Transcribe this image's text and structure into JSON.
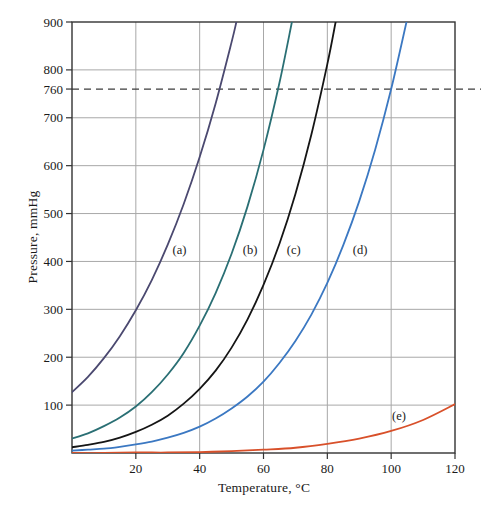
{
  "page": {
    "background": "#ffffff"
  },
  "chart_data": {
    "type": "line",
    "title": "",
    "xlabel": "Temperature, °C",
    "ylabel": "Pressure, mmHg",
    "xlim": [
      0,
      120
    ],
    "ylim": [
      0,
      900
    ],
    "x_ticks": [
      20,
      40,
      60,
      80,
      100,
      120
    ],
    "y_ticks": [
      100,
      200,
      300,
      400,
      500,
      600,
      700,
      800,
      900
    ],
    "x_gridlines": [
      20,
      40,
      60,
      80,
      100
    ],
    "y_gridlines": [
      100,
      200,
      300,
      400,
      500,
      600,
      700,
      800
    ],
    "grid": true,
    "legend_position": "none",
    "reference_line": {
      "value": 760,
      "label": "760",
      "style": "dashed"
    },
    "series": [
      {
        "name": "(a)",
        "color": "#4b4970",
        "points": [
          [
            0,
            127
          ],
          [
            5,
            159
          ],
          [
            10,
            198
          ],
          [
            15,
            244
          ],
          [
            20,
            298
          ],
          [
            25,
            361
          ],
          [
            30,
            435
          ],
          [
            35,
            520
          ],
          [
            40,
            618
          ],
          [
            45,
            730
          ],
          [
            50,
            858
          ],
          [
            51.5,
            900
          ]
        ]
      },
      {
        "name": "(b)",
        "color": "#2a6f74",
        "points": [
          [
            0,
            30
          ],
          [
            5,
            41
          ],
          [
            10,
            56
          ],
          [
            15,
            74
          ],
          [
            20,
            97
          ],
          [
            25,
            127
          ],
          [
            30,
            164
          ],
          [
            35,
            209
          ],
          [
            40,
            266
          ],
          [
            45,
            334
          ],
          [
            50,
            416
          ],
          [
            55,
            515
          ],
          [
            60,
            633
          ],
          [
            65,
            773
          ],
          [
            68.9,
            900
          ]
        ]
      },
      {
        "name": "(c)",
        "color": "#151515",
        "points": [
          [
            0,
            12
          ],
          [
            5,
            17
          ],
          [
            10,
            23
          ],
          [
            15,
            32
          ],
          [
            20,
            44
          ],
          [
            25,
            59
          ],
          [
            30,
            78
          ],
          [
            35,
            103
          ],
          [
            40,
            134
          ],
          [
            45,
            172
          ],
          [
            50,
            220
          ],
          [
            55,
            279
          ],
          [
            60,
            351
          ],
          [
            65,
            437
          ],
          [
            70,
            541
          ],
          [
            75,
            665
          ],
          [
            80,
            812
          ],
          [
            82.6,
            900
          ]
        ]
      },
      {
        "name": "(d)",
        "color": "#3b78c2",
        "points": [
          [
            0,
            5
          ],
          [
            5,
            7
          ],
          [
            10,
            9
          ],
          [
            15,
            13
          ],
          [
            20,
            18
          ],
          [
            25,
            24
          ],
          [
            30,
            32
          ],
          [
            35,
            42
          ],
          [
            40,
            55
          ],
          [
            45,
            72
          ],
          [
            50,
            93
          ],
          [
            55,
            118
          ],
          [
            60,
            149
          ],
          [
            65,
            188
          ],
          [
            70,
            234
          ],
          [
            75,
            289
          ],
          [
            80,
            355
          ],
          [
            85,
            434
          ],
          [
            90,
            526
          ],
          [
            95,
            634
          ],
          [
            100,
            760
          ],
          [
            104.8,
            900
          ]
        ]
      },
      {
        "name": "(e)",
        "color": "#d8502a",
        "points": [
          [
            0,
            0
          ],
          [
            10,
            0
          ],
          [
            20,
            1
          ],
          [
            30,
            1
          ],
          [
            40,
            2
          ],
          [
            50,
            4
          ],
          [
            60,
            7
          ],
          [
            70,
            11
          ],
          [
            80,
            19
          ],
          [
            90,
            30
          ],
          [
            100,
            46
          ],
          [
            110,
            69
          ],
          [
            120,
            102
          ]
        ]
      }
    ],
    "curve_labels": [
      {
        "text": "(a)",
        "t": 31.5,
        "p": 416
      },
      {
        "text": "(b)",
        "t": 53.5,
        "p": 416
      },
      {
        "text": "(c)",
        "t": 67.3,
        "p": 416
      },
      {
        "text": "(d)",
        "t": 88.0,
        "p": 416
      },
      {
        "text": "(e)",
        "t": 100.3,
        "p": 68
      }
    ],
    "layout": {
      "plot": {
        "left": 72,
        "top": 22,
        "right": 455,
        "bottom": 453
      },
      "dashed_line_right_extent": 481,
      "tick_length": 6,
      "colors": {
        "frame": "#333333",
        "grid": "#a8a8a8",
        "dashed": "#3d3d3d",
        "text": "#1a1a1a"
      }
    }
  }
}
